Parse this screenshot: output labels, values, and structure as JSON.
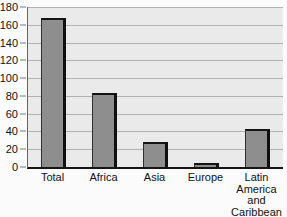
{
  "chart_data": {
    "type": "bar",
    "title": "",
    "xlabel": "",
    "ylabel": "",
    "categories": [
      "Total",
      "Africa",
      "Asia",
      "Europe",
      "Latin America and Caribbean"
    ],
    "values": [
      168,
      83,
      28,
      4,
      43
    ],
    "ylim": [
      0,
      180
    ],
    "ytick_step": 20,
    "ytick_labels": [
      "180",
      "160",
      "140",
      "120",
      "100",
      "80",
      "60",
      "40",
      "20",
      "0"
    ],
    "grid": true,
    "legend": false,
    "colors": {
      "bar_fill": "#8e8e8e",
      "bar_border": "#1c1c1c",
      "plot_bg": "#eaeaea",
      "gridline": "#b2b2b2",
      "axis": "#151515",
      "text": "#111111",
      "page_bg": "#fbfbfb"
    }
  }
}
